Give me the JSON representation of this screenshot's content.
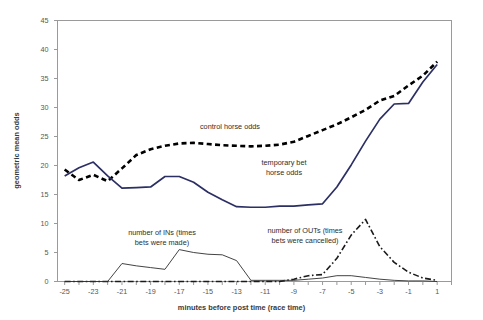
{
  "chart_data": {
    "type": "line",
    "title": "",
    "xlabel": "minutes before post time (race time)",
    "ylabel": "geometric mean odds",
    "xlim": [
      -25.5,
      2.0
    ],
    "ylim": [
      0,
      45
    ],
    "yticks": [
      0,
      5,
      10,
      15,
      20,
      25,
      30,
      35,
      40,
      45
    ],
    "xticks": [
      -25,
      -23,
      -21,
      -19,
      -17,
      -15,
      -13,
      -11,
      -9,
      -7,
      -5,
      -3,
      -1,
      1
    ],
    "grid": false,
    "legend": "none (in-plot annotations)",
    "x": [
      -25,
      -24,
      -23,
      -22,
      -21,
      -20,
      -19,
      -18,
      -17,
      -16,
      -15,
      -14,
      -13,
      -12,
      -11,
      -10,
      -9,
      -8,
      -7,
      -6,
      -5,
      -4,
      -3,
      -2,
      -1,
      0,
      1
    ],
    "series": [
      {
        "name": "control horse odds",
        "style": "dashed",
        "color": "#000000",
        "values": [
          19.3,
          17.5,
          18.4,
          17.3,
          19.5,
          21.8,
          22.8,
          23.4,
          23.8,
          23.9,
          23.7,
          23.5,
          23.4,
          23.3,
          23.4,
          23.6,
          24.1,
          25.1,
          26.1,
          27.1,
          28.3,
          29.6,
          31.2,
          32.0,
          33.8,
          35.5,
          37.9
        ]
      },
      {
        "name": "temporary bet horse odds",
        "style": "solid",
        "color": "#2b2f63",
        "values": [
          18.2,
          19.6,
          20.6,
          18.2,
          16.1,
          16.2,
          16.3,
          18.1,
          18.1,
          17.1,
          15.4,
          14.1,
          12.9,
          12.8,
          12.8,
          13.0,
          13.0,
          13.2,
          13.4,
          16.3,
          20.1,
          24.2,
          28.0,
          30.6,
          30.7,
          34.4,
          37.4
        ]
      },
      {
        "name": "number of INs (times bets were made)",
        "style": "thin-solid",
        "color": "#2e2e2e",
        "values": [
          0.0,
          0.0,
          0.0,
          0.0,
          3.1,
          2.7,
          2.4,
          2.1,
          5.5,
          5.0,
          4.7,
          4.6,
          3.6,
          0.2,
          0.2,
          0.2,
          0.2,
          0.4,
          0.6,
          1.0,
          1.0,
          0.7,
          0.4,
          0.2,
          0.1,
          0.1,
          0.0
        ]
      },
      {
        "name": "number of OUTs (times bets were cancelled)",
        "style": "dash-dot",
        "color": "#1a1a1a",
        "values": [
          0.0,
          0.0,
          0.0,
          0.0,
          0.0,
          0.0,
          0.0,
          0.0,
          0.0,
          0.0,
          0.0,
          0.0,
          0.0,
          0.0,
          0.0,
          0.0,
          0.4,
          1.0,
          1.2,
          4.0,
          8.0,
          10.7,
          6.0,
          3.3,
          1.6,
          0.6,
          0.2
        ]
      }
    ],
    "annotations": [
      {
        "id": "control",
        "text": "control horse odds",
        "x": -14.5,
        "y": 25.7
      },
      {
        "id": "temporary",
        "text": "temporary bet\nhorse odds",
        "x": -8.2,
        "y": 19.6
      },
      {
        "id": "ins",
        "text": "number of INs (times\nbets were made)",
        "x": -17.0,
        "y": 9.0
      },
      {
        "id": "outs",
        "text": "number of OUTs (times\nbets were cancelled)",
        "x": -8.5,
        "y": 9.2
      }
    ]
  },
  "axis": {
    "y_tick_labels": [
      "0",
      "5",
      "10",
      "15",
      "20",
      "25",
      "30",
      "35",
      "40",
      "45"
    ],
    "x_tick_labels": [
      "-25",
      "-23",
      "-21",
      "-19",
      "-17",
      "-15",
      "-13",
      "-11",
      "-9",
      "-7",
      "-5",
      "-3",
      "-1",
      "1"
    ],
    "y_title": "geometric mean odds",
    "x_title": "minutes before post time (race time)"
  },
  "annotation_text": {
    "control": "control horse odds",
    "temporary": "temporary bet\nhorse odds",
    "ins": "number of INs (times\nbets were made)",
    "outs": "number of OUTs (times\nbets were cancelled)"
  },
  "colors": {
    "control_line": "#000000",
    "temporary_line": "#2b2f63",
    "ins_line": "#2e2e2e",
    "outs_line": "#1a1a1a",
    "frame": "#9a9a9a",
    "background": "#ffffff"
  }
}
